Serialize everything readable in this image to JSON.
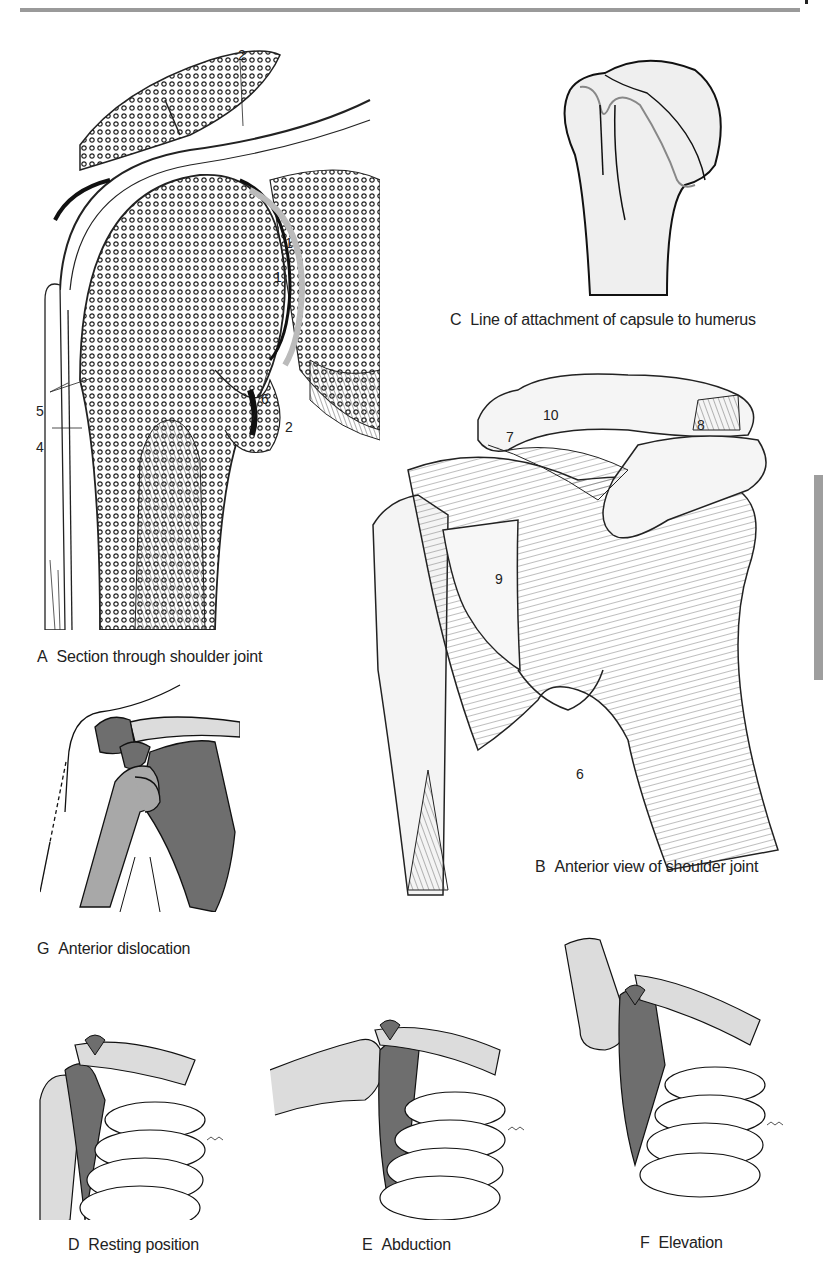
{
  "page": {
    "header_rule": true,
    "thumb_tab_color": "#9e9e9e"
  },
  "figures": {
    "A": {
      "letter": "A",
      "caption": "Section through shoulder joint",
      "labels": [
        "1",
        "1",
        "2",
        "2",
        "4",
        "5",
        "6"
      ]
    },
    "B": {
      "letter": "B",
      "caption": "Anterior view of shoulder joint",
      "labels": [
        "6",
        "7",
        "8",
        "9",
        "10"
      ]
    },
    "C": {
      "letter": "C",
      "caption": "Line of attachment of capsule to humerus"
    },
    "D": {
      "letter": "D",
      "caption": "Resting position"
    },
    "E": {
      "letter": "E",
      "caption": "Abduction"
    },
    "F": {
      "letter": "F",
      "caption": "Elevation"
    },
    "G": {
      "letter": "G",
      "caption": "Anterior dislocation"
    }
  },
  "colors": {
    "bone_light": "#dcdcdc",
    "bone_dark": "#6e6e6e",
    "humerus_mid": "#a8a8a8",
    "line": "#1a1a1a"
  }
}
